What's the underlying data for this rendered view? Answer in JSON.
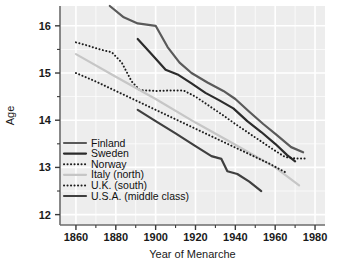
{
  "chart_data": {
    "type": "line",
    "title": "",
    "xlabel": "Year of Menarche",
    "ylabel": "Age",
    "xlim": [
      1852,
      1985
    ],
    "ylim": [
      11.78,
      16.42
    ],
    "xticks": [
      1860,
      1880,
      1900,
      1920,
      1940,
      1960,
      1980
    ],
    "xtick_labels": [
      "1860",
      "1880",
      "1900",
      "1920",
      "1940",
      "1960",
      "1980"
    ],
    "xminor_ticks": [
      1870,
      1890,
      1910,
      1930,
      1950,
      1970
    ],
    "yticks": [
      12,
      13,
      14,
      15,
      16
    ],
    "ytick_labels": [
      "12",
      "13",
      "14",
      "15",
      "16"
    ],
    "yminor_ticks": [
      12.5,
      13.5,
      14.5,
      15.5
    ],
    "grid": true,
    "grid_color": "#ffffff",
    "plot_bg": "#ededed",
    "legend_position": "lower-left",
    "series": [
      {
        "name": "Finland",
        "style": "solid",
        "color": "#5a5a5a",
        "width": 2.2,
        "points": [
          [
            1877,
            16.42
          ],
          [
            1884,
            16.18
          ],
          [
            1891,
            16.05
          ],
          [
            1900,
            16.0
          ],
          [
            1906,
            15.55
          ],
          [
            1912,
            15.22
          ],
          [
            1918,
            15.0
          ],
          [
            1926,
            14.8
          ],
          [
            1934,
            14.62
          ],
          [
            1940,
            14.45
          ],
          [
            1947,
            14.18
          ],
          [
            1954,
            13.92
          ],
          [
            1961,
            13.68
          ],
          [
            1968,
            13.43
          ],
          [
            1974,
            13.32
          ]
        ]
      },
      {
        "name": "Sweden",
        "style": "solid",
        "color": "#2b2b2b",
        "width": 2.2,
        "points": [
          [
            1891,
            15.72
          ],
          [
            1898,
            15.4
          ],
          [
            1905,
            15.07
          ],
          [
            1911,
            14.97
          ],
          [
            1918,
            14.78
          ],
          [
            1925,
            14.58
          ],
          [
            1932,
            14.42
          ],
          [
            1939,
            14.25
          ],
          [
            1946,
            13.98
          ],
          [
            1953,
            13.75
          ],
          [
            1960,
            13.5
          ],
          [
            1966,
            13.26
          ],
          [
            1970,
            13.13
          ]
        ]
      },
      {
        "name": "Norway",
        "style": "dotted",
        "color": "#1c1c1c",
        "width": 2.0,
        "points": [
          [
            1860,
            15.65
          ],
          [
            1866,
            15.58
          ],
          [
            1872,
            15.5
          ],
          [
            1878,
            15.44
          ],
          [
            1883,
            15.22
          ],
          [
            1888,
            14.82
          ],
          [
            1892,
            14.64
          ],
          [
            1900,
            14.62
          ],
          [
            1908,
            14.63
          ],
          [
            1914,
            14.63
          ],
          [
            1920,
            14.5
          ],
          [
            1927,
            14.3
          ],
          [
            1934,
            14.1
          ],
          [
            1940,
            13.92
          ],
          [
            1947,
            13.72
          ],
          [
            1953,
            13.55
          ],
          [
            1959,
            13.38
          ],
          [
            1965,
            13.22
          ],
          [
            1970,
            13.19
          ],
          [
            1975,
            13.19
          ]
        ]
      },
      {
        "name": "Italy (north)",
        "style": "solid",
        "color": "#c6c6c6",
        "width": 2.2,
        "points": [
          [
            1860,
            15.4
          ],
          [
            1880,
            14.92
          ],
          [
            1900,
            14.45
          ],
          [
            1920,
            13.95
          ],
          [
            1940,
            13.48
          ],
          [
            1960,
            13.0
          ],
          [
            1972,
            12.62
          ]
        ]
      },
      {
        "name": "U.K. (south)",
        "style": "dotted",
        "color": "#1c1c1c",
        "width": 2.0,
        "points": [
          [
            1860,
            15.0
          ],
          [
            1870,
            14.82
          ],
          [
            1880,
            14.62
          ],
          [
            1890,
            14.42
          ],
          [
            1900,
            14.22
          ],
          [
            1910,
            14.02
          ],
          [
            1920,
            13.82
          ],
          [
            1930,
            13.62
          ],
          [
            1940,
            13.42
          ],
          [
            1950,
            13.22
          ],
          [
            1958,
            13.06
          ],
          [
            1965,
            12.9
          ]
        ]
      },
      {
        "name": "U.S.A. (middle class)",
        "style": "solid",
        "color": "#3f3f3f",
        "width": 2.2,
        "points": [
          [
            1891,
            14.22
          ],
          [
            1900,
            13.98
          ],
          [
            1910,
            13.72
          ],
          [
            1920,
            13.45
          ],
          [
            1928,
            13.24
          ],
          [
            1933,
            13.18
          ],
          [
            1936,
            12.92
          ],
          [
            1941,
            12.86
          ],
          [
            1947,
            12.7
          ],
          [
            1953,
            12.5
          ]
        ]
      }
    ]
  }
}
